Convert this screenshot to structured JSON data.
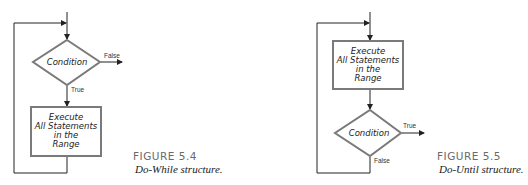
{
  "figures": [
    {
      "number": "FIGURE 5.4",
      "caption": "Do-While structure.",
      "decision": {
        "label": "Condition",
        "exit_label": "False",
        "continue_label": "True"
      },
      "process": {
        "lines": [
          "Execute",
          "All Statements",
          "in the",
          "Range"
        ]
      }
    },
    {
      "number": "FIGURE 5.5",
      "caption": "Do-Until structure.",
      "process": {
        "lines": [
          "Execute",
          "All Statements",
          "in the",
          "Range"
        ]
      },
      "decision": {
        "label": "Condition",
        "exit_label": "True",
        "loop_label": "False"
      }
    }
  ],
  "colors": {
    "shape_border": "#7a7a7a",
    "line": "#222222",
    "figure_number": "#6a6a6a"
  }
}
